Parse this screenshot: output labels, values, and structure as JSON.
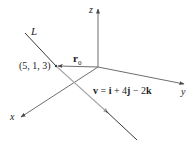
{
  "diagram": {
    "type": "3d-line-vector-diagram",
    "axes": {
      "x_label": "x",
      "y_label": "y",
      "z_label": "z"
    },
    "line": {
      "label": "L"
    },
    "point": {
      "label": "(5, 1, 3)"
    },
    "position_vector": {
      "label_main": "r",
      "label_sub": "0"
    },
    "direction_vector": {
      "label": "v = i + 4j − 2k",
      "parts": {
        "v": "v",
        "eq": " = ",
        "i": "i",
        "plus": " + 4",
        "j": "j",
        "minus": " − 2",
        "k": "k"
      }
    },
    "colors": {
      "axis": "#6e6e6e",
      "line_dark": "#3a3a3a",
      "line_light": "#a8a8a8",
      "text": "#222222"
    }
  }
}
